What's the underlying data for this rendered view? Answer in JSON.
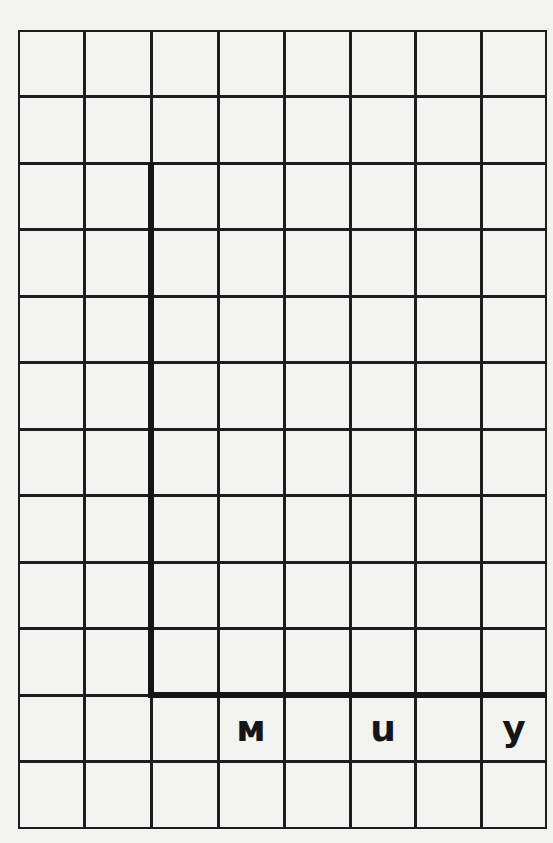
{
  "worksheet": {
    "grid": {
      "columns": 8,
      "rows": 12
    },
    "axis": {
      "vertical": {
        "column_line": 2,
        "from_row_line": 2,
        "to_row_line": 10
      },
      "horizontal": {
        "row_line": 10,
        "from_column_line": 2,
        "to_column_line": 8
      }
    },
    "letters": [
      {
        "text": "м",
        "row": 10,
        "column": 3
      },
      {
        "text": "u",
        "row": 10,
        "column": 5
      },
      {
        "text": "y",
        "row": 10,
        "column": 7
      }
    ],
    "colors": {
      "lines": "#1d1d1d",
      "paper": "#f3f3f1",
      "text": "#161616"
    }
  }
}
